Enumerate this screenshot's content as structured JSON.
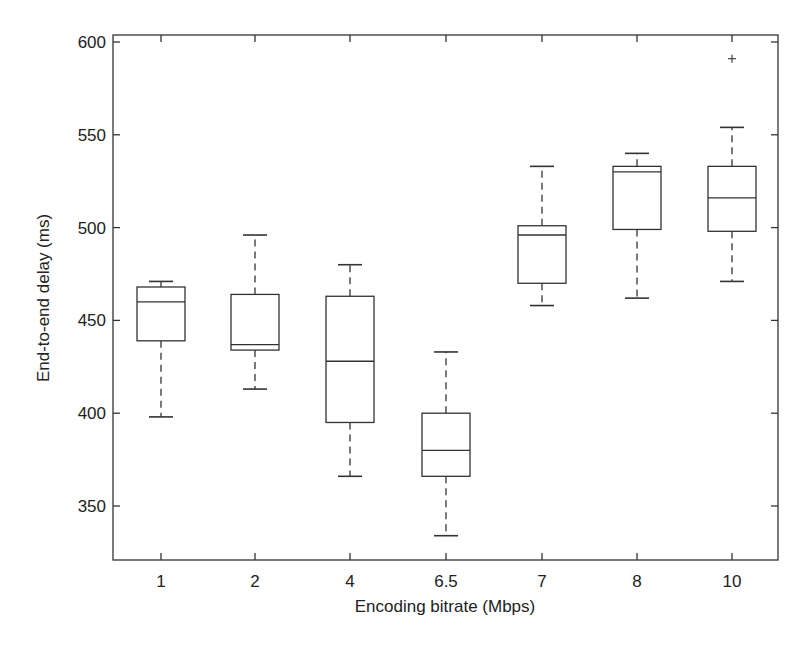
{
  "chart_data": {
    "type": "box",
    "title": "",
    "xlabel": "Encoding bitrate (Mbps)",
    "ylabel": "End-to-end delay (ms)",
    "ylim": [
      320,
      603
    ],
    "yticks": [
      350,
      400,
      450,
      500,
      550,
      600
    ],
    "grid": false,
    "legend": null,
    "categories": [
      "1",
      "2",
      "4",
      "6.5",
      "7",
      "8",
      "10"
    ],
    "boxes": [
      {
        "category": "1",
        "whisker_low": 398,
        "q1": 439,
        "median": 460,
        "q3": 468,
        "whisker_high": 471,
        "outliers": []
      },
      {
        "category": "2",
        "whisker_low": 413,
        "q1": 434,
        "median": 437,
        "q3": 464,
        "whisker_high": 496,
        "outliers": []
      },
      {
        "category": "4",
        "whisker_low": 366,
        "q1": 395,
        "median": 428,
        "q3": 463,
        "whisker_high": 480,
        "outliers": []
      },
      {
        "category": "6.5",
        "whisker_low": 334,
        "q1": 366,
        "median": 380,
        "q3": 400,
        "whisker_high": 433,
        "outliers": []
      },
      {
        "category": "7",
        "whisker_low": 458,
        "q1": 470,
        "median": 496,
        "q3": 501,
        "whisker_high": 533,
        "outliers": []
      },
      {
        "category": "8",
        "whisker_low": 462,
        "q1": 499,
        "median": 530,
        "q3": 533,
        "whisker_high": 540,
        "outliers": []
      },
      {
        "category": "10",
        "whisker_low": 471,
        "q1": 498,
        "median": 516,
        "q3": 533,
        "whisker_high": 554,
        "outliers": [
          591
        ]
      }
    ]
  },
  "colors": {
    "stroke": "#333333",
    "background": "#ffffff"
  }
}
